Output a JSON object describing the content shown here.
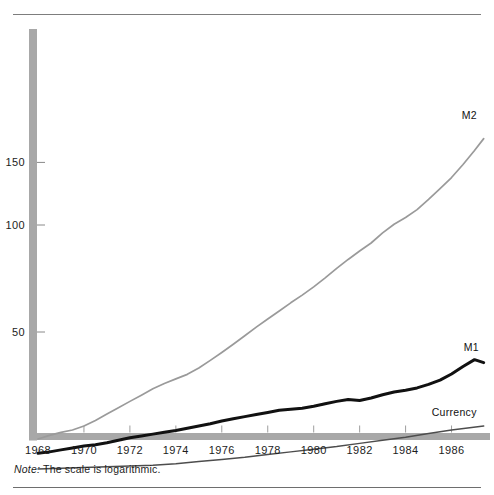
{
  "figure": {
    "note_label": "Note:",
    "note_text": "The scale is logarithmic.",
    "colors": {
      "m2": "#9a9a9a",
      "m1": "#111111",
      "currency": "#4d4d4d",
      "axis_band": "#a8a8a8",
      "rule": "#7d7d7d",
      "background": "#ffffff"
    }
  },
  "chart_data": {
    "type": "line",
    "title": "",
    "subtitle": "",
    "xlabel": "",
    "ylabel": "",
    "log_scale": true,
    "grid": false,
    "legend_position": "inline-right",
    "annotations": [
      "Note: The scale is logarithmic."
    ],
    "xlim": [
      1968,
      1987.5
    ],
    "ylim": [
      20,
      230
    ],
    "x_ticks": [
      1968,
      1970,
      1972,
      1974,
      1976,
      1978,
      1980,
      1982,
      1984,
      1986
    ],
    "x_tick_labels": [
      "1968",
      "1970",
      "1972",
      "1974",
      "1976",
      "1978",
      "1980",
      "1982",
      "1984",
      "1986"
    ],
    "y_ticks": [
      50,
      100,
      150
    ],
    "y_tick_labels": [
      "50",
      "100",
      "150"
    ],
    "series": [
      {
        "name": "M2",
        "label": "M2",
        "color": "#9a9a9a",
        "x": [
          1968.0,
          1968.5,
          1969.0,
          1969.5,
          1970.0,
          1970.5,
          1971.0,
          1971.5,
          1972.0,
          1972.5,
          1973.0,
          1973.5,
          1974.0,
          1974.5,
          1975.0,
          1975.5,
          1976.0,
          1976.5,
          1977.0,
          1977.5,
          1978.0,
          1978.5,
          1979.0,
          1979.5,
          1980.0,
          1980.5,
          1981.0,
          1981.5,
          1982.0,
          1982.5,
          1983.0,
          1983.5,
          1984.0,
          1984.5,
          1985.0,
          1985.5,
          1986.0,
          1986.5,
          1987.0,
          1987.4
        ],
        "y": [
          25.0,
          25.6,
          26.1,
          26.5,
          27.2,
          28.2,
          29.4,
          30.6,
          31.9,
          33.2,
          34.6,
          35.8,
          36.9,
          38.0,
          39.6,
          41.6,
          43.8,
          46.2,
          48.8,
          51.6,
          54.4,
          57.3,
          60.4,
          63.5,
          67.0,
          71.0,
          75.5,
          80.0,
          84.5,
          89.0,
          95.0,
          100.5,
          105.0,
          110.5,
          118.0,
          126.5,
          136.0,
          148.0,
          162.0,
          175.0
        ]
      },
      {
        "name": "M1",
        "label": "M1",
        "color": "#111111",
        "x": [
          1968.0,
          1968.5,
          1969.0,
          1969.5,
          1970.0,
          1970.5,
          1971.0,
          1971.5,
          1972.0,
          1972.5,
          1973.0,
          1973.5,
          1974.0,
          1974.5,
          1975.0,
          1975.5,
          1976.0,
          1976.5,
          1977.0,
          1977.5,
          1978.0,
          1978.5,
          1979.0,
          1979.5,
          1980.0,
          1980.5,
          1981.0,
          1981.5,
          1982.0,
          1982.5,
          1983.0,
          1983.5,
          1984.0,
          1984.5,
          1985.0,
          1985.5,
          1986.0,
          1986.5,
          1987.0,
          1987.4
        ],
        "y": [
          22.8,
          23.0,
          23.3,
          23.6,
          23.9,
          24.1,
          24.4,
          24.8,
          25.2,
          25.5,
          25.8,
          26.1,
          26.4,
          26.8,
          27.2,
          27.6,
          28.1,
          28.5,
          28.9,
          29.3,
          29.7,
          30.1,
          30.3,
          30.5,
          30.9,
          31.4,
          31.9,
          32.3,
          32.1,
          32.6,
          33.3,
          33.9,
          34.3,
          34.8,
          35.6,
          36.6,
          38.1,
          40.0,
          41.8,
          41.0
        ]
      },
      {
        "name": "Currency",
        "label": "Currency",
        "color": "#4d4d4d",
        "x": [
          1968.0,
          1969.0,
          1970.0,
          1971.0,
          1972.0,
          1973.0,
          1974.0,
          1975.0,
          1976.0,
          1977.0,
          1978.0,
          1979.0,
          1980.0,
          1981.0,
          1982.0,
          1983.0,
          1984.0,
          1985.0,
          1986.0,
          1987.4
        ],
        "y": [
          20.6,
          20.7,
          20.8,
          20.9,
          21.0,
          21.1,
          21.3,
          21.6,
          21.9,
          22.2,
          22.6,
          23.0,
          23.4,
          23.8,
          24.3,
          24.8,
          25.3,
          25.9,
          26.5,
          27.2
        ]
      }
    ]
  },
  "labels": {
    "m2": "M2",
    "m1": "M1",
    "currency": "Currency"
  }
}
